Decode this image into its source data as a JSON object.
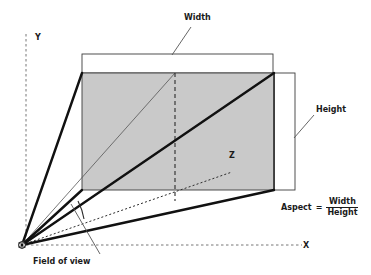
{
  "figure": {
    "labels": {
      "width": "Width",
      "height": "Height",
      "axis_y": "Y",
      "axis_x": "X",
      "axis_z": "Z",
      "field_of_view": "Field of view"
    },
    "formula": {
      "name": "Aspect",
      "equals": "=",
      "numerator": "Width",
      "denominator": "Height"
    },
    "colors": {
      "near_plane_fill": "#c9c9c9",
      "stroke_dark": "#1a1a1a",
      "stroke_thin": "#555555",
      "background": "#ffffff"
    },
    "geometry": {
      "origin": {
        "x": 22,
        "y": 245
      },
      "near_plane_rect": {
        "x": 82,
        "y": 73,
        "width": 192,
        "height": 117
      },
      "width_guide_rect": {
        "x": 82,
        "y": 54,
        "width": 191,
        "height": 19
      },
      "height_guide_rect": {
        "x": 274,
        "y": 73,
        "width": 21,
        "height": 117
      },
      "axis_y_dashed": {
        "x": 26,
        "y_top": 34,
        "y_bottom": 245
      },
      "axis_x_dashed": {
        "y": 245,
        "x_left": 26,
        "x_right": 300
      },
      "center_dashed_vertical": {
        "x": 175,
        "y_top": 73,
        "y_bottom": 201
      },
      "z_axis_dotted_end": {
        "x": 232,
        "y": 172
      },
      "fov_leader_line": {
        "x1": 100,
        "y1": 253,
        "x2": 72,
        "y2": 205
      },
      "width_leader_line": {
        "x1": 191,
        "y1": 26,
        "x2": 172,
        "y2": 55
      },
      "height_leader_line": {
        "x1": 315,
        "y1": 114,
        "x2": 294,
        "y2": 137
      }
    }
  }
}
